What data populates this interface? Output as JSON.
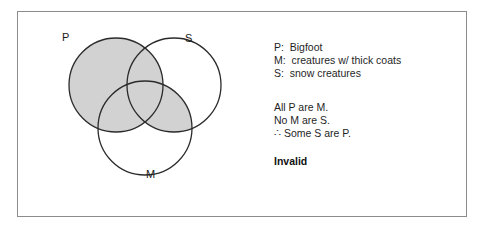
{
  "figure": {
    "border_color": "#8c8c8c",
    "background_color": "#ffffff"
  },
  "venn": {
    "shade_color": "#d2d2d2",
    "stroke_color": "#2b2b2b",
    "shaded_description": "entire P circle and the S-and-M overlap region",
    "circles": [
      {
        "id": "P",
        "label": "P",
        "cx": 98,
        "cy": 73,
        "r": 47
      },
      {
        "id": "S",
        "label": "S",
        "cx": 156,
        "cy": 73,
        "r": 47
      },
      {
        "id": "M",
        "label": "M",
        "cx": 127,
        "cy": 116,
        "r": 47
      }
    ],
    "labels": {
      "p": "P",
      "s": "S",
      "m": "M"
    }
  },
  "legend": {
    "lines": [
      "P:  Bigfoot",
      "M:  creatures w/ thick coats",
      "S:  snow creatures"
    ]
  },
  "argument": {
    "premises": [
      "All P are M.",
      "No M are S.",
      "∴ Some S are P."
    ],
    "verdict": "Invalid"
  }
}
